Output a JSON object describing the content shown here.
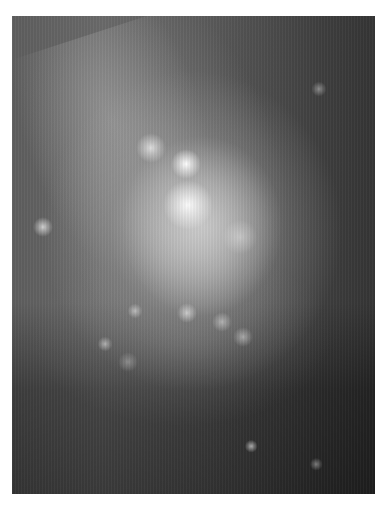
{
  "image": {
    "subject": "galaxy",
    "palette": {
      "background_page": "#ffffff",
      "sky_dark": "#353535",
      "sky_mid": "#5e5e5e",
      "glow": "#c8c8c8",
      "core": "#ffffff"
    },
    "frame": {
      "x": 12,
      "y": 16,
      "width": 363,
      "height": 478
    },
    "sources": [
      {
        "name": "nucleus-upper",
        "x": 186,
        "y": 164,
        "size": 12,
        "brightness": 1.0
      },
      {
        "name": "nucleus-lower",
        "x": 188,
        "y": 205,
        "size": 20,
        "brightness": 0.95
      },
      {
        "name": "knot-upper-left",
        "x": 151,
        "y": 148,
        "size": 12,
        "brightness": 0.7
      },
      {
        "name": "left-star",
        "x": 43,
        "y": 227,
        "size": 8,
        "brightness": 0.7
      },
      {
        "name": "right-knot",
        "x": 240,
        "y": 237,
        "size": 14,
        "brightness": 0.35
      },
      {
        "name": "upper-right-knot",
        "x": 319,
        "y": 89,
        "size": 6,
        "brightness": 0.4
      },
      {
        "name": "lower-knot-1",
        "x": 135,
        "y": 311,
        "size": 6,
        "brightness": 0.5
      },
      {
        "name": "lower-knot-2",
        "x": 187,
        "y": 313,
        "size": 8,
        "brightness": 0.6
      },
      {
        "name": "lower-knot-3",
        "x": 222,
        "y": 322,
        "size": 8,
        "brightness": 0.45
      },
      {
        "name": "lower-knot-4",
        "x": 243,
        "y": 337,
        "size": 8,
        "brightness": 0.45
      },
      {
        "name": "lower-knot-5",
        "x": 105,
        "y": 344,
        "size": 6,
        "brightness": 0.5
      },
      {
        "name": "lower-knot-6",
        "x": 128,
        "y": 362,
        "size": 8,
        "brightness": 0.3
      },
      {
        "name": "bottom-star-1",
        "x": 251,
        "y": 446,
        "size": 5,
        "brightness": 0.6
      },
      {
        "name": "bottom-star-2",
        "x": 316,
        "y": 464,
        "size": 5,
        "brightness": 0.4
      }
    ]
  }
}
